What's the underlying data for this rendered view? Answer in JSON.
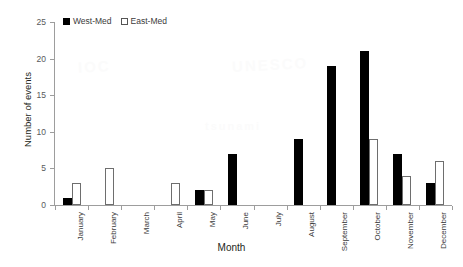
{
  "chart_data": {
    "type": "bar",
    "title": "",
    "subtitle": "",
    "xlabel": "Month",
    "ylabel": "Number of events",
    "categories": [
      "January",
      "February",
      "March",
      "April",
      "May",
      "June",
      "July",
      "August",
      "September",
      "October",
      "November",
      "December"
    ],
    "series": [
      {
        "name": "West-Med",
        "color": "#000000",
        "style": "filled",
        "values": [
          1,
          0,
          0,
          0,
          2,
          7,
          0,
          9,
          19,
          21,
          7,
          3
        ]
      },
      {
        "name": "East-Med",
        "color": "#ffffff",
        "style": "outlined",
        "values": [
          3,
          5,
          0,
          3,
          2,
          0,
          0,
          0,
          0,
          9,
          4,
          6
        ]
      }
    ],
    "ylim": [
      0,
      25
    ],
    "yticks": [
      0,
      5,
      10,
      15,
      20,
      25
    ],
    "ytick_labels": [
      "0",
      "5",
      "10",
      "15",
      "20",
      "25"
    ],
    "grid": false,
    "legend_position": "top-left-inside",
    "legend_entries": [
      "West-Med",
      "East-Med"
    ]
  },
  "watermark": {
    "left_text": "IOC",
    "center_text": "UNESCO",
    "small_text": "tsunami"
  }
}
